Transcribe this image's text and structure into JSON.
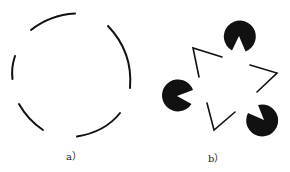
{
  "figure": {
    "panels": [
      {
        "id": "a",
        "label": "a）",
        "description": "Broken circle illusion: five arc segments of a circle with gaps"
      },
      {
        "id": "b",
        "label": "b）",
        "description": "Kanizsa triangle illusion: three pac-man shapes and three V-shaped line corners"
      }
    ],
    "colors": {
      "ink": "#111111",
      "background": "#ffffff"
    }
  }
}
